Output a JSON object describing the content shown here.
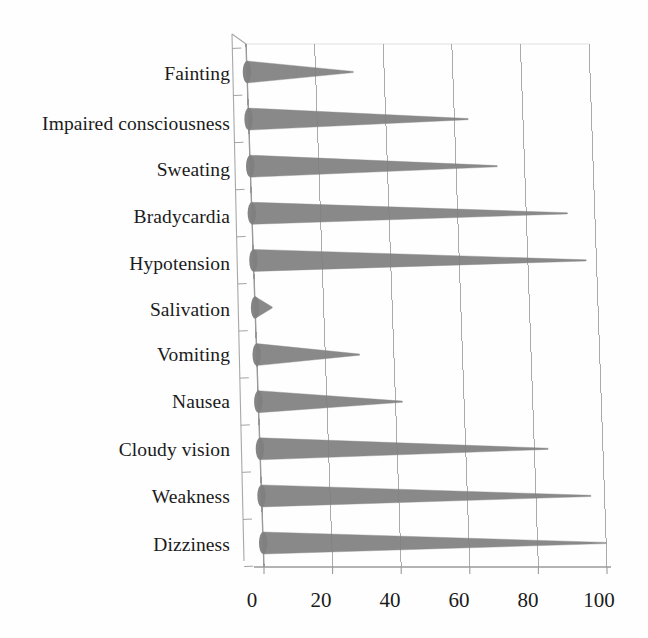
{
  "chart_data": {
    "type": "bar",
    "orientation": "horizontal",
    "style": "3d-cone",
    "title": "",
    "subtitle": "",
    "xlabel": "",
    "ylabel": "",
    "xlim": [
      0,
      100
    ],
    "xticks": [
      0,
      20,
      40,
      60,
      80,
      100
    ],
    "xtick_labels": [
      "0",
      "20",
      "40",
      "60",
      "80",
      "100"
    ],
    "grid": true,
    "grid_axis": "x",
    "legend": false,
    "legend_position": "none",
    "bar_color": "#808080",
    "axis_color": "#9a9a9a",
    "grid_color": "#8c8c8c",
    "background_color": "#ffffff",
    "text_color": "#1b1b1b",
    "categories": [
      "Fainting",
      "Impaired consciousness",
      "Sweating",
      "Bradycardia",
      "Hypotension",
      "Salivation",
      "Vomiting",
      "Nausea",
      "Cloudy vision",
      "Weakness",
      "Dizziness"
    ],
    "values": [
      31,
      64,
      72,
      92,
      97,
      5,
      30,
      42,
      84,
      96,
      100
    ],
    "series": [
      {
        "name": "Symptom frequency (%)",
        "values": [
          31,
          64,
          72,
          92,
          97,
          5,
          30,
          42,
          84,
          96,
          100
        ]
      }
    ]
  },
  "axis": {
    "tick_0": "0",
    "tick_20": "20",
    "tick_40": "40",
    "tick_60": "60",
    "tick_80": "80",
    "tick_100": "100"
  },
  "labels": {
    "fainting": "Fainting",
    "impaired_consciousness": "Impaired consciousness",
    "sweating": "Sweating",
    "bradycardia": "Bradycardia",
    "hypotension": "Hypotension",
    "salivation": "Salivation",
    "vomiting": "Vomiting",
    "nausea": "Nausea",
    "cloudy_vision": "Cloudy vision",
    "weakness": "Weakness",
    "dizziness": "Dizziness"
  }
}
